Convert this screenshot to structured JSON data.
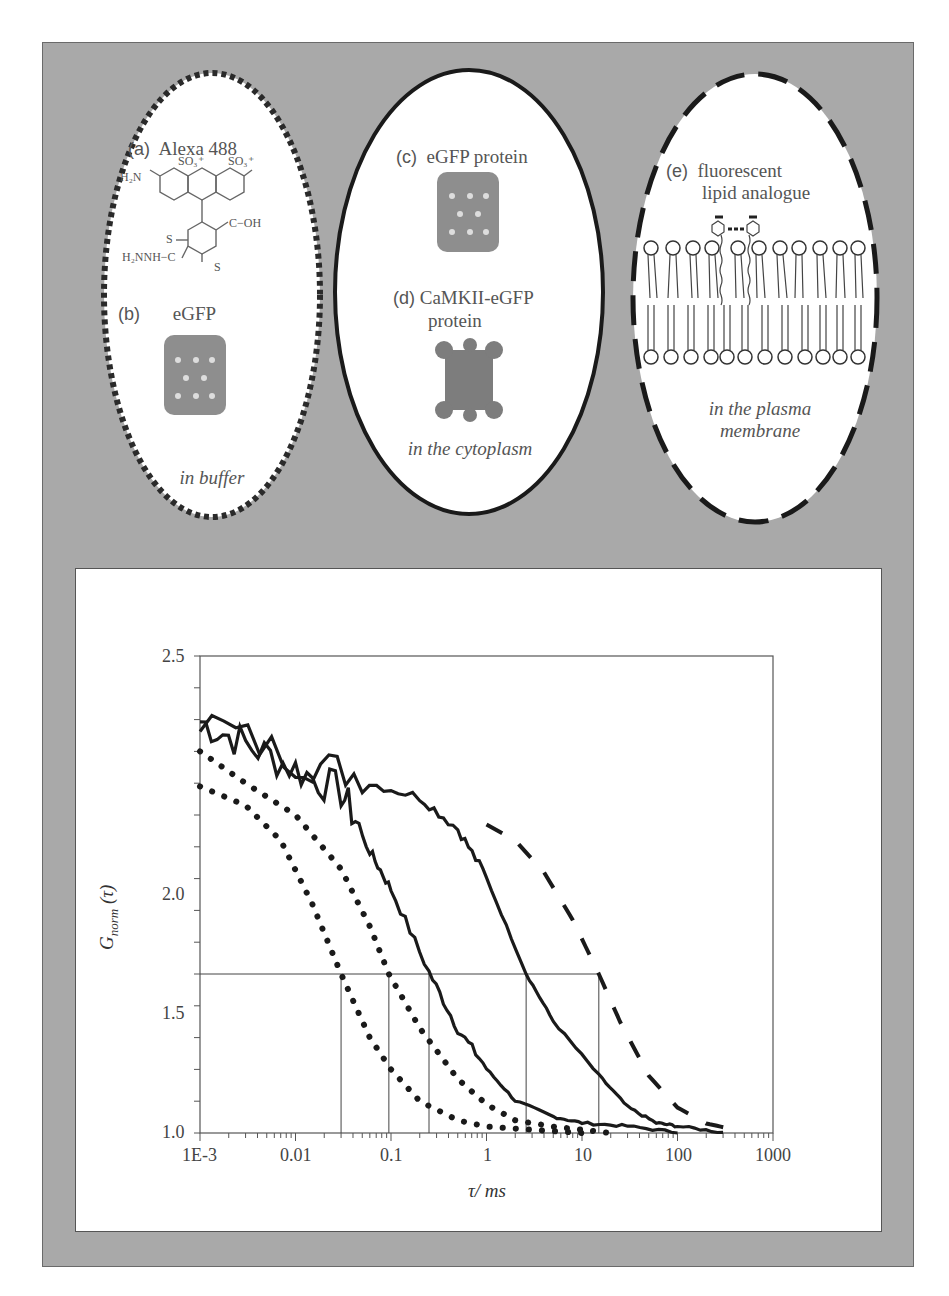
{
  "figure": {
    "panels": {
      "a": {
        "tag": "(a)",
        "title": "Alexa 488"
      },
      "b": {
        "tag": "(b)",
        "title": "eGFP",
        "context": "in buffer"
      },
      "c": {
        "tag": "(c)",
        "title": "eGFP protein"
      },
      "d": {
        "tag": "(d)",
        "title_line1": "CaMKII-eGFP",
        "title_line2": "protein",
        "context": "in the cytoplasm"
      },
      "e": {
        "tag": "(e)",
        "title_line1": "fluorescent",
        "title_line2": "lipid analogue",
        "context_line1": "in the plasma",
        "context_line2": "membrane"
      }
    },
    "chem": {
      "h2n": "H₂N",
      "so3a": "SO₃⁺",
      "so3b": "SO₃⁺",
      "o_ring": "O",
      "cooh": "C−OH",
      "o_dbl": "O",
      "s1": "S",
      "s2": "S",
      "hydrazide": "H₂NNH−C",
      "o_dbl2": "O"
    },
    "oval_styles": {
      "buffer": "short-dashed",
      "cytoplasm": "solid",
      "membrane": "long-dashed"
    },
    "colors": {
      "panel_bg": "#a9a9a9",
      "panel_border": "#6a6a6a",
      "curve": "#1a1a1a",
      "text": "#555555"
    }
  },
  "chart_data": {
    "type": "line",
    "title": "",
    "xlabel": "τ/ ms",
    "ylabel": "G_norm (τ)",
    "xscale": "log",
    "xlim": [
      0.001,
      1000
    ],
    "ylim": [
      1.0,
      2.5
    ],
    "x_tick_labels": [
      "1E-3",
      "0.01",
      "0.1",
      "1",
      "10",
      "100",
      "1000"
    ],
    "y_tick_labels": [
      "1.0",
      "1.5",
      "2.0",
      "2.5"
    ],
    "grid": false,
    "legend": "none",
    "reference_line": {
      "y": 1.5,
      "x_from": 0.001,
      "x_to": 15
    },
    "series": [
      {
        "name": "Alexa 488 (in buffer)",
        "style": "dotted",
        "tau_half": 0.03,
        "points": [
          [
            0.001,
            2.09
          ],
          [
            0.003,
            2.03
          ],
          [
            0.007,
            1.92
          ],
          [
            0.015,
            1.72
          ],
          [
            0.03,
            1.5
          ],
          [
            0.06,
            1.3
          ],
          [
            0.1,
            1.2
          ],
          [
            0.2,
            1.1
          ],
          [
            0.5,
            1.04
          ],
          [
            1,
            1.02
          ],
          [
            3,
            1.01
          ],
          [
            10,
            1.0
          ]
        ]
      },
      {
        "name": "eGFP (in buffer)",
        "style": "dotted",
        "tau_half": 0.095,
        "points": [
          [
            0.001,
            2.2
          ],
          [
            0.003,
            2.1
          ],
          [
            0.01,
            2.0
          ],
          [
            0.03,
            1.83
          ],
          [
            0.06,
            1.65
          ],
          [
            0.095,
            1.5
          ],
          [
            0.2,
            1.33
          ],
          [
            0.5,
            1.17
          ],
          [
            1,
            1.09
          ],
          [
            2,
            1.04
          ],
          [
            5,
            1.02
          ],
          [
            10,
            1.01
          ],
          [
            20,
            1.0
          ]
        ]
      },
      {
        "name": "eGFP protein (in the cytoplasm)",
        "style": "solid-noisy",
        "tau_half": 0.25,
        "points": [
          [
            0.001,
            2.27
          ],
          [
            0.003,
            2.2
          ],
          [
            0.01,
            2.12
          ],
          [
            0.03,
            2.05
          ],
          [
            0.06,
            1.88
          ],
          [
            0.1,
            1.76
          ],
          [
            0.25,
            1.5
          ],
          [
            0.5,
            1.32
          ],
          [
            1,
            1.2
          ],
          [
            2,
            1.1
          ],
          [
            5,
            1.05
          ],
          [
            10,
            1.03
          ],
          [
            30,
            1.02
          ],
          [
            100,
            1.0
          ]
        ]
      },
      {
        "name": "CaMKII-eGFP (in the cytoplasm)",
        "style": "solid-noisy",
        "tau_half": 2.6,
        "points": [
          [
            0.001,
            2.28
          ],
          [
            0.01,
            2.15
          ],
          [
            0.05,
            2.1
          ],
          [
            0.2,
            2.05
          ],
          [
            0.5,
            1.95
          ],
          [
            1,
            1.8
          ],
          [
            2.6,
            1.5
          ],
          [
            5,
            1.35
          ],
          [
            15,
            1.18
          ],
          [
            30,
            1.08
          ],
          [
            60,
            1.03
          ],
          [
            100,
            1.02
          ],
          [
            300,
            1.0
          ]
        ]
      },
      {
        "name": "fluorescent lipid analogue (in the plasma membrane)",
        "style": "dashed",
        "tau_half": 15,
        "points": [
          [
            1,
            1.97
          ],
          [
            2,
            1.92
          ],
          [
            4,
            1.82
          ],
          [
            8,
            1.67
          ],
          [
            15,
            1.5
          ],
          [
            25,
            1.35
          ],
          [
            50,
            1.18
          ],
          [
            100,
            1.08
          ],
          [
            200,
            1.03
          ],
          [
            400,
            1.01
          ]
        ]
      }
    ]
  }
}
